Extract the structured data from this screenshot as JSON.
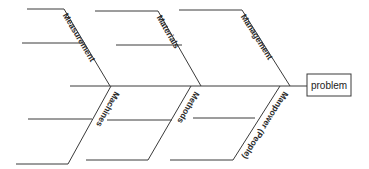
{
  "diagram": {
    "type": "fishbone",
    "effect": "problem",
    "spine": {
      "x1": 70,
      "y1": 86,
      "x2": 307,
      "y2": 86
    },
    "problem_box": {
      "x": 307,
      "y": 74,
      "w": 44,
      "h": 22
    },
    "categories_top": [
      {
        "label": "Measurement",
        "top": [
          27,
          64,
          9
        ],
        "end": [
          110,
          86
        ],
        "sub": [
          22,
          85,
          43
        ]
      },
      {
        "label": "Materials",
        "top": [
          95,
          158,
          11
        ],
        "end": [
          201,
          86
        ],
        "sub": [
          116,
          182,
          45
        ]
      },
      {
        "label": "Management",
        "top": [
          179,
          242,
          10
        ],
        "end": [
          290,
          86
        ],
        "sub": null
      }
    ],
    "categories_bottom": [
      {
        "label": "Machines",
        "start": [
          111,
          86
        ],
        "bottom": [
          16,
          68,
          164
        ],
        "sub": [
          28,
          92,
          119
        ]
      },
      {
        "label": "Methods",
        "start": [
          191,
          86
        ],
        "bottom": [
          86,
          148,
          160
        ],
        "sub": [
          107,
          172,
          120
        ]
      },
      {
        "label": "Manpower (People)",
        "start": [
          280,
          86
        ],
        "bottom": [
          170,
          233,
          160
        ],
        "sub": [
          193,
          255,
          118
        ]
      }
    ]
  },
  "colors": {
    "line": "#3a3a3a",
    "text": "#2a2a2a",
    "background": "#ffffff"
  }
}
